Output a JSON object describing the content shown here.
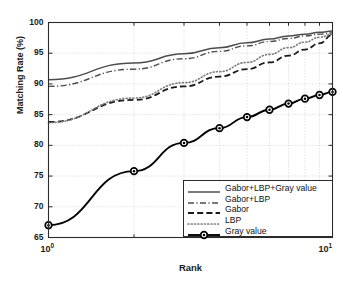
{
  "chart_data": {
    "type": "line",
    "title": "",
    "xlabel": "Rank",
    "ylabel": "Matching Rate (%)",
    "xscale": "log",
    "xlim": [
      1,
      10
    ],
    "ylim": [
      65,
      100
    ],
    "yticks": [
      65,
      70,
      75,
      80,
      85,
      90,
      95,
      100
    ],
    "xticks": [
      1,
      10
    ],
    "xtick_labels": [
      "10⁰",
      "10¹"
    ],
    "grid": true,
    "legend_position": "lower right",
    "x": [
      1,
      2,
      3,
      4,
      5,
      6,
      7,
      8,
      9,
      10
    ],
    "series": [
      {
        "name": "Gabor+LBP+Gray value",
        "style": "solid",
        "color": "#4d4d4d",
        "marker": "none",
        "values": [
          90.7,
          93.4,
          94.9,
          95.9,
          96.7,
          97.3,
          97.8,
          98.1,
          98.4,
          98.6
        ]
      },
      {
        "name": "Gabor+LBP",
        "style": "dashdot",
        "color": "#4d4d4d",
        "marker": "none",
        "values": [
          89.6,
          92.4,
          94.1,
          95.3,
          96.2,
          96.9,
          97.4,
          97.8,
          98.1,
          98.3
        ]
      },
      {
        "name": "Gabor",
        "style": "dashed",
        "color": "#1a1a1a",
        "marker": "none",
        "values": [
          83.8,
          87.4,
          89.6,
          91.2,
          92.4,
          93.5,
          94.6,
          95.6,
          96.6,
          98.0
        ]
      },
      {
        "name": "LBP",
        "style": "dotted",
        "color": "#808080",
        "marker": "none",
        "values": [
          83.7,
          87.7,
          90.2,
          92.0,
          93.5,
          94.8,
          95.9,
          96.8,
          97.6,
          98.1
        ]
      },
      {
        "name": "Gray value",
        "style": "solid-marker",
        "color": "#000000",
        "marker": "circle",
        "values": [
          67.0,
          75.8,
          80.4,
          82.8,
          84.6,
          85.8,
          86.8,
          87.6,
          88.2,
          88.7
        ]
      }
    ]
  },
  "axis": {
    "ylabel": "Matching Rate (%)",
    "xlabel": "Rank",
    "ytick_labels": [
      "100",
      "95",
      "90",
      "85",
      "80",
      "75",
      "70",
      "65"
    ],
    "xtick_base": "10",
    "xtick_exp_left": "0",
    "xtick_exp_right": "1"
  },
  "legend": {
    "items": [
      {
        "label": "Gabor+LBP+Gray value",
        "style": "solid",
        "color": "#4d4d4d",
        "marker": "none"
      },
      {
        "label": "Gabor+LBP",
        "style": "dashdot",
        "color": "#4d4d4d",
        "marker": "none"
      },
      {
        "label": "Gabor",
        "style": "dashed",
        "color": "#1a1a1a",
        "marker": "none"
      },
      {
        "label": "LBP",
        "style": "dotted",
        "color": "#808080",
        "marker": "none"
      },
      {
        "label": "Gray value",
        "style": "solid-marker",
        "color": "#000000",
        "marker": "circle"
      }
    ]
  },
  "colors": {
    "axis": "#2b2b2b",
    "grid": "#c8c8c8",
    "background": "#ffffff"
  }
}
